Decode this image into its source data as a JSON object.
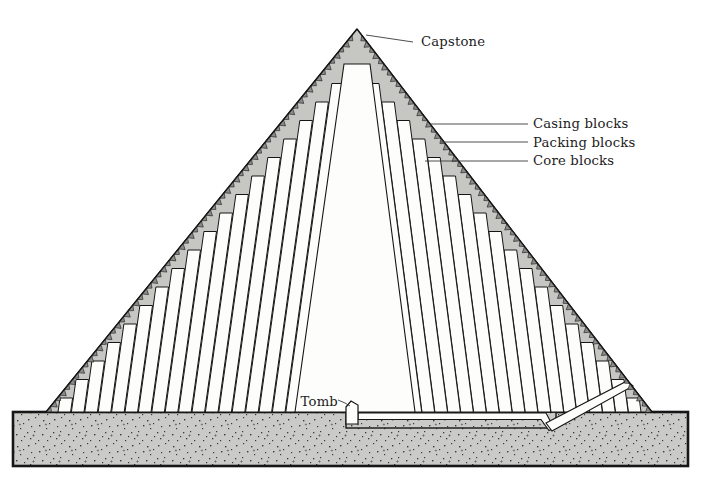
{
  "labels": {
    "capstone": "Capstone",
    "casing": "Casing blocks",
    "packing": "Packing blocks",
    "core": "Core blocks",
    "tomb": "Tomb"
  },
  "colors": {
    "background": "#ffffff",
    "packing_fill": "#c6c6c2",
    "ground_fill": "#cacac8",
    "block_fill": "#fdfdfb",
    "casing_fill": "#8a8a8a",
    "outline": "#161616",
    "leader": "#3a3a3a",
    "text": "#1c1c1c"
  }
}
